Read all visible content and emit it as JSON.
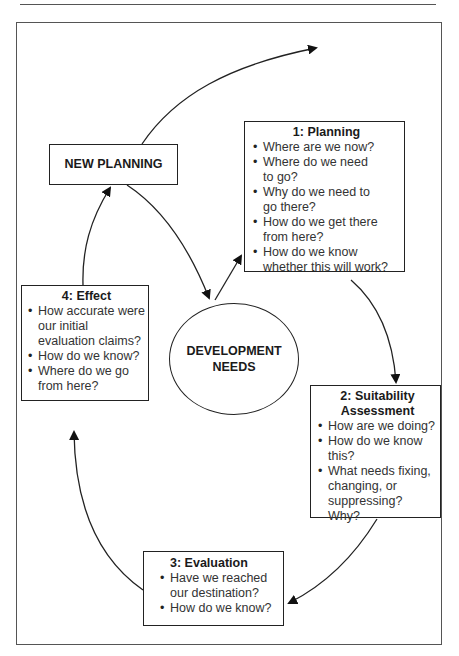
{
  "diagram": {
    "new_planning": {
      "label": "NEW PLANNING"
    },
    "center": {
      "line1": "DEVELOPMENT",
      "line2": "NEEDS"
    },
    "stages": [
      {
        "title": "1: Planning",
        "items": [
          "Where are we now?",
          "Where do we need to go?",
          "Why do we need to go there?",
          "How do we get there from here?",
          "How do we know whether this will work?"
        ]
      },
      {
        "title_line1": "2: Suitability",
        "title_line2": "Assessment",
        "items": [
          "How are we doing?",
          "How do we know this?",
          "What needs fixing, changing, or suppressing? Why?"
        ]
      },
      {
        "title": "3: Evaluation",
        "items": [
          "Have we reached our destination?",
          "How do we know?"
        ]
      },
      {
        "title": "4: Effect",
        "items": [
          "How accurate were our initial evaluation claims?",
          "How do we know?",
          "Where do we go from here?"
        ]
      }
    ],
    "colors": {
      "line": "#222222",
      "frame": "#555555",
      "background": "#ffffff"
    }
  }
}
